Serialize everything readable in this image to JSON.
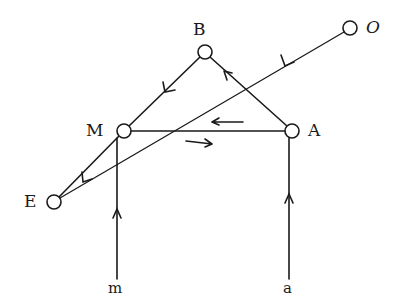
{
  "diagram": {
    "nodes": [
      {
        "id": "O",
        "label": "O",
        "x": 350,
        "y": 28
      },
      {
        "id": "B",
        "label": "B",
        "x": 205,
        "y": 52
      },
      {
        "id": "M",
        "label": "M",
        "x": 124,
        "y": 131
      },
      {
        "id": "A",
        "label": "A",
        "x": 292,
        "y": 131
      },
      {
        "id": "E",
        "label": "E",
        "x": 54,
        "y": 202
      }
    ],
    "terminals": [
      {
        "id": "m",
        "label": "m",
        "x": 117,
        "y": 290
      },
      {
        "id": "a",
        "label": "a",
        "x": 290,
        "y": 290
      }
    ],
    "edges": [
      {
        "from": "B",
        "to": "M",
        "arrow": "toward M"
      },
      {
        "from": "A",
        "to": "B",
        "arrow": "toward B"
      },
      {
        "from": "O",
        "to": "E",
        "arrow": "toward E"
      },
      {
        "from": "M",
        "to": "E",
        "arrow": "toward E"
      },
      {
        "from": "A",
        "to": "M",
        "arrow": "left (A to M)"
      },
      {
        "from": "M",
        "to": "A",
        "arrow": "right (M to A)"
      },
      {
        "from": "m",
        "to": "M",
        "arrow": "upward"
      },
      {
        "from": "a",
        "to": "A",
        "arrow": "upward"
      }
    ],
    "stroke_color": "#1a1a1a"
  }
}
